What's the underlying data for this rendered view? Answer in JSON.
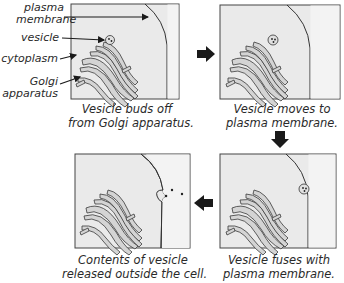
{
  "labels": {
    "plasma_membrane": [
      "plasma",
      "membrane"
    ],
    "vesicle": "vesicle",
    "cytoplasm": "cytoplasm",
    "golgi": [
      "Golgi",
      "apparatus"
    ]
  },
  "panels": [
    {
      "step": 1,
      "caption": [
        "Vesicle buds off",
        "from Golgi apparatus."
      ]
    },
    {
      "step": 2,
      "caption": [
        "Vesicle moves to",
        "plasma membrane."
      ]
    },
    {
      "step": 3,
      "caption": [
        "Vesicle fuses with",
        "plasma membrane."
      ]
    },
    {
      "step": 4,
      "caption": [
        "Contents of vesicle",
        "released outside the cell."
      ]
    }
  ],
  "arrows": [
    "right",
    "down",
    "left"
  ],
  "colors": {
    "cell_fill": "#eaeaea",
    "outside_fill": "#f3f3f3",
    "outline": "#333333",
    "golgi_fill": "#d2d2d2",
    "arrow": "#1a1a1a"
  }
}
